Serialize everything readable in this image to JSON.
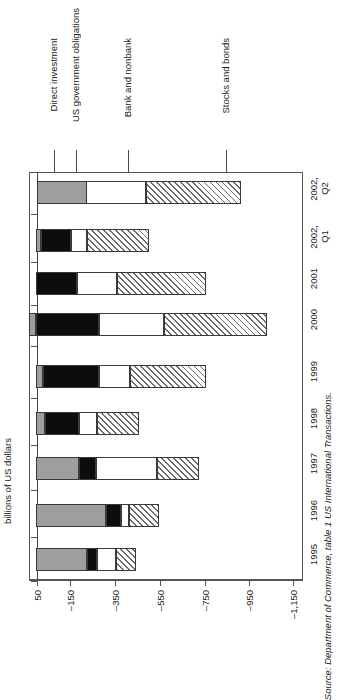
{
  "axis_title": "billions of US dollars",
  "source": "Source: Department of Commerce, table 1 US International Transactions.",
  "callouts": [
    {
      "name": "direct-investment",
      "label": "Direct investment"
    },
    {
      "name": "us-government-obligations",
      "label": "US government obligations"
    },
    {
      "name": "bank-and-nonbank",
      "label": "Bank and nonbank"
    },
    {
      "name": "stocks-and-bonds",
      "label": "Stocks and bonds"
    }
  ],
  "xticks": [
    "50",
    "–150",
    "–350",
    "–550",
    "–750",
    "–950",
    "–1,150"
  ],
  "categories": [
    "1995",
    "1996",
    "1997",
    "1998",
    "1999",
    "2000",
    "2001",
    "2002,\nQ1",
    "2002,\nQ2"
  ],
  "chart_data": {
    "type": "bar",
    "orientation": "horizontal-stacked",
    "title": "",
    "subtitle": "",
    "xlabel": "billions of US dollars",
    "ylabel": "",
    "xlim": [
      50,
      -1150
    ],
    "grid": false,
    "legend_position": "callout-arrows-top",
    "note": "Values are negative (capital inflows). Magnitudes read off axis; bars stack from the 50 baseline leftward-to-rightward as drawn.",
    "categories": [
      "1995",
      "1996",
      "1997",
      "1998",
      "1999",
      "2000",
      "2001",
      "2002, Q1",
      "2002, Q2"
    ],
    "series": [
      {
        "name": "Direct investment",
        "color": "#9e9e9e",
        "pattern": "solid-gray",
        "values": [
          -230,
          -315,
          -193,
          -40,
          -31,
          31,
          0,
          -22,
          -224
        ]
      },
      {
        "name": "US government obligations",
        "color": "#0d0d0d",
        "pattern": "solid-black",
        "values": [
          -45,
          -67,
          -76,
          -152,
          -251,
          -283,
          -184,
          -135,
          0
        ]
      },
      {
        "name": "Bank and nonbank",
        "color": "#ffffff",
        "pattern": "white",
        "values": [
          -85,
          -36,
          -274,
          -81,
          -139,
          -291,
          -179,
          -72,
          -269
        ]
      },
      {
        "name": "Stocks and bonds",
        "color": "#6b6b6b",
        "pattern": "diagonal-hatch",
        "values": [
          -90,
          -134,
          -188,
          -188,
          -341,
          -462,
          -399,
          -278,
          -426
        ]
      }
    ],
    "totals": [
      -450,
      -552,
      -731,
      -461,
      -762,
      -1005,
      -762,
      -507,
      -919
    ]
  },
  "bars": [
    {
      "category": "2002,\nQ2",
      "top": 181,
      "segments": [
        {
          "series": "Direct investment",
          "class": "s-direct",
          "x": 37,
          "w": 50
        },
        {
          "series": "Bank and nonbank",
          "class": "s-bank",
          "x": 87,
          "w": 60
        },
        {
          "series": "Stocks and bonds",
          "class": "s-stocks",
          "x": 147,
          "w": 95
        }
      ]
    },
    {
      "category": "2002,\nQ1",
      "top": 229,
      "segments": [
        {
          "series": "Direct investment",
          "class": "s-direct",
          "x": 37,
          "w": 5
        },
        {
          "series": "US government obligations",
          "class": "s-usgov",
          "x": 42,
          "w": 30
        },
        {
          "series": "Bank and nonbank",
          "class": "s-bank",
          "x": 72,
          "w": 16
        },
        {
          "series": "Stocks and bonds",
          "class": "s-stocks",
          "x": 88,
          "w": 62
        }
      ]
    },
    {
      "category": "2001",
      "top": 272,
      "segments": [
        {
          "series": "US government obligations",
          "class": "s-usgov",
          "x": 37,
          "w": 41
        },
        {
          "series": "Bank and nonbank",
          "class": "s-bank",
          "x": 78,
          "w": 40
        },
        {
          "series": "Stocks and bonds",
          "class": "s-stocks",
          "x": 118,
          "w": 89
        }
      ]
    },
    {
      "category": "2000",
      "top": 313,
      "segments": [
        {
          "series": "Direct investment",
          "class": "s-direct",
          "x": 30,
          "w": 7
        },
        {
          "series": "US government obligations",
          "class": "s-usgov",
          "x": 37,
          "w": 63
        },
        {
          "series": "Bank and nonbank",
          "class": "s-bank",
          "x": 100,
          "w": 65
        },
        {
          "series": "Stocks and bonds",
          "class": "s-stocks",
          "x": 165,
          "w": 103
        }
      ]
    },
    {
      "category": "1999",
      "top": 365,
      "segments": [
        {
          "series": "Direct investment",
          "class": "s-direct",
          "x": 37,
          "w": 7
        },
        {
          "series": "US government obligations",
          "class": "s-usgov",
          "x": 44,
          "w": 56
        },
        {
          "series": "Bank and nonbank",
          "class": "s-bank",
          "x": 100,
          "w": 31
        },
        {
          "series": "Stocks and bonds",
          "class": "s-stocks",
          "x": 131,
          "w": 76
        }
      ]
    },
    {
      "category": "1998",
      "top": 412,
      "segments": [
        {
          "series": "Direct investment",
          "class": "s-direct",
          "x": 37,
          "w": 9
        },
        {
          "series": "US government obligations",
          "class": "s-usgov",
          "x": 46,
          "w": 34
        },
        {
          "series": "Bank and nonbank",
          "class": "s-bank",
          "x": 80,
          "w": 18
        },
        {
          "series": "Stocks and bonds",
          "class": "s-stocks",
          "x": 98,
          "w": 42
        }
      ]
    },
    {
      "category": "1997",
      "top": 457,
      "segments": [
        {
          "series": "Direct investment",
          "class": "s-direct",
          "x": 37,
          "w": 43
        },
        {
          "series": "US government obligations",
          "class": "s-usgov",
          "x": 80,
          "w": 17
        },
        {
          "series": "Bank and nonbank",
          "class": "s-bank",
          "x": 97,
          "w": 61
        },
        {
          "series": "Stocks and bonds",
          "class": "s-stocks",
          "x": 158,
          "w": 42
        }
      ]
    },
    {
      "category": "1996",
      "top": 504,
      "segments": [
        {
          "series": "Direct investment",
          "class": "s-direct",
          "x": 37,
          "w": 70
        },
        {
          "series": "US government obligations",
          "class": "s-usgov",
          "x": 107,
          "w": 15
        },
        {
          "series": "Bank and nonbank",
          "class": "s-bank",
          "x": 122,
          "w": 8
        },
        {
          "series": "Stocks and bonds",
          "class": "s-stocks",
          "x": 130,
          "w": 30
        }
      ]
    },
    {
      "category": "1995",
      "top": 548,
      "segments": [
        {
          "series": "Direct investment",
          "class": "s-direct",
          "x": 37,
          "w": 51
        },
        {
          "series": "US government obligations",
          "class": "s-usgov",
          "x": 88,
          "w": 10
        },
        {
          "series": "Bank and nonbank",
          "class": "s-bank",
          "x": 98,
          "w": 19
        },
        {
          "series": "Stocks and bonds",
          "class": "s-stocks",
          "x": 117,
          "w": 20
        }
      ]
    }
  ]
}
